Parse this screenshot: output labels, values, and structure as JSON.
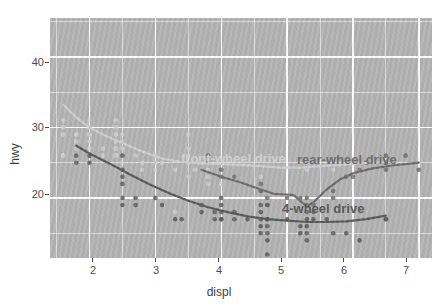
{
  "chart_data": {
    "type": "scatter",
    "title": "",
    "xlabel": "displ",
    "ylabel": "hwy",
    "xlim": [
      1.4,
      7.2
    ],
    "ylim": [
      11.5,
      45.5
    ],
    "xticks": [
      2,
      3,
      4,
      5,
      6,
      7
    ],
    "yticks": [
      20,
      30,
      40
    ],
    "grid": true,
    "legend": "none (direct labels on plot)",
    "annotations": [
      {
        "label": "front-wheel drive",
        "x": 3.45,
        "y": 25.1,
        "color": "#cfcfcf"
      },
      {
        "label": "rear-wheel drive",
        "x": 5.35,
        "y": 25.0,
        "color": "#6e6e6e"
      },
      {
        "label": "4-wheel drive",
        "x": 5.05,
        "y": 17.6,
        "color": "#5a5a5a"
      }
    ],
    "series": [
      {
        "name": "front-wheel drive",
        "color": "#cfcfcf",
        "points": [
          [
            1.6,
            29
          ],
          [
            1.6,
            29
          ],
          [
            1.6,
            31
          ],
          [
            1.6,
            30
          ],
          [
            1.6,
            26
          ],
          [
            1.6,
            26
          ],
          [
            1.8,
            29
          ],
          [
            1.8,
            29
          ],
          [
            1.8,
            28
          ],
          [
            1.8,
            27
          ],
          [
            1.8,
            26
          ],
          [
            1.8,
            25
          ],
          [
            2.0,
            29
          ],
          [
            2.0,
            29
          ],
          [
            2.0,
            28
          ],
          [
            2.0,
            27
          ],
          [
            2.0,
            31
          ],
          [
            2.0,
            30
          ],
          [
            2.2,
            26
          ],
          [
            2.2,
            27
          ],
          [
            2.4,
            27
          ],
          [
            2.4,
            26
          ],
          [
            2.4,
            29
          ],
          [
            2.4,
            30
          ],
          [
            2.4,
            31
          ],
          [
            2.4,
            26
          ],
          [
            2.4,
            27
          ],
          [
            2.4,
            29
          ],
          [
            2.4,
            28
          ],
          [
            2.5,
            29
          ],
          [
            2.5,
            28
          ],
          [
            2.5,
            27
          ],
          [
            2.5,
            24
          ],
          [
            2.5,
            25
          ],
          [
            2.7,
            26
          ],
          [
            2.7,
            20
          ],
          [
            2.8,
            24
          ],
          [
            2.8,
            25
          ],
          [
            3.0,
            26
          ],
          [
            3.0,
            25
          ],
          [
            3.0,
            24
          ],
          [
            3.1,
            25
          ],
          [
            3.3,
            24
          ],
          [
            3.3,
            18
          ],
          [
            3.5,
            29
          ],
          [
            3.5,
            27
          ],
          [
            3.5,
            26
          ],
          [
            3.5,
            25
          ],
          [
            3.5,
            23
          ],
          [
            3.6,
            24
          ],
          [
            3.8,
            25
          ],
          [
            3.8,
            24
          ],
          [
            3.8,
            23
          ],
          [
            3.8,
            22
          ],
          [
            4.0,
            23
          ],
          [
            4.0,
            22
          ],
          [
            4.2,
            23
          ],
          [
            4.6,
            23
          ],
          [
            5.3,
            25
          ],
          [
            5.3,
            24
          ],
          [
            5.7,
            24
          ],
          [
            6.1,
            24
          ]
        ],
        "smooth": [
          [
            1.6,
            33.2
          ],
          [
            1.8,
            31.4
          ],
          [
            2.0,
            30.0
          ],
          [
            2.2,
            29.0
          ],
          [
            2.5,
            27.8
          ],
          [
            2.8,
            26.6
          ],
          [
            3.1,
            25.6
          ],
          [
            3.4,
            25.1
          ],
          [
            3.7,
            24.9
          ],
          [
            4.0,
            24.8
          ],
          [
            4.3,
            24.7
          ],
          [
            4.6,
            24.5
          ],
          [
            4.9,
            24.3
          ],
          [
            5.2,
            24.3
          ],
          [
            5.5,
            24.5
          ],
          [
            5.8,
            24.7
          ],
          [
            6.1,
            24.9
          ],
          [
            6.5,
            25.1
          ]
        ]
      },
      {
        "name": "rear-wheel drive",
        "color": "#6e6e6e",
        "points": [
          [
            3.8,
            26
          ],
          [
            3.8,
            25
          ],
          [
            4.0,
            23
          ],
          [
            4.0,
            24
          ],
          [
            4.2,
            23
          ],
          [
            4.6,
            22
          ],
          [
            4.6,
            21
          ],
          [
            4.6,
            21
          ],
          [
            4.7,
            20
          ],
          [
            4.7,
            19
          ],
          [
            5.0,
            20
          ],
          [
            5.2,
            20
          ],
          [
            5.3,
            20
          ],
          [
            5.3,
            19
          ],
          [
            5.3,
            18
          ],
          [
            5.4,
            19
          ],
          [
            5.4,
            18
          ],
          [
            5.7,
            20
          ],
          [
            5.7,
            21
          ],
          [
            5.9,
            23
          ],
          [
            6.0,
            23
          ],
          [
            6.1,
            24
          ],
          [
            6.2,
            25
          ],
          [
            6.2,
            25
          ],
          [
            6.5,
            25
          ],
          [
            6.5,
            24
          ],
          [
            6.5,
            25
          ],
          [
            6.5,
            26
          ],
          [
            6.8,
            26
          ],
          [
            7.0,
            24
          ]
        ],
        "smooth": [
          [
            3.7,
            24.0
          ],
          [
            4.0,
            23.0
          ],
          [
            4.3,
            22.2
          ],
          [
            4.6,
            21.2
          ],
          [
            4.8,
            20.6
          ],
          [
            5.0,
            20.5
          ],
          [
            5.1,
            20.4
          ],
          [
            5.2,
            19.6
          ],
          [
            5.3,
            18.8
          ],
          [
            5.4,
            19.4
          ],
          [
            5.6,
            21.2
          ],
          [
            5.8,
            22.6
          ],
          [
            6.0,
            23.5
          ],
          [
            6.3,
            24.2
          ],
          [
            6.6,
            24.6
          ],
          [
            6.9,
            24.9
          ],
          [
            7.0,
            25.0
          ]
        ]
      },
      {
        "name": "4-wheel drive",
        "color": "#5a5a5a",
        "points": [
          [
            1.8,
            26
          ],
          [
            1.8,
            25
          ],
          [
            2.0,
            26
          ],
          [
            2.0,
            25
          ],
          [
            2.5,
            26
          ],
          [
            2.5,
            24
          ],
          [
            2.5,
            23
          ],
          [
            2.5,
            22
          ],
          [
            2.5,
            20
          ],
          [
            2.5,
            19
          ],
          [
            2.7,
            20
          ],
          [
            2.7,
            19
          ],
          [
            3.0,
            20
          ],
          [
            3.1,
            19
          ],
          [
            3.3,
            17
          ],
          [
            3.4,
            17
          ],
          [
            3.7,
            19
          ],
          [
            3.7,
            18
          ],
          [
            3.9,
            18
          ],
          [
            3.9,
            17
          ],
          [
            4.0,
            20
          ],
          [
            4.0,
            19
          ],
          [
            4.0,
            18
          ],
          [
            4.0,
            17
          ],
          [
            4.0,
            17
          ],
          [
            4.2,
            17
          ],
          [
            4.2,
            18
          ],
          [
            4.4,
            17
          ],
          [
            4.6,
            19
          ],
          [
            4.6,
            18
          ],
          [
            4.6,
            17
          ],
          [
            4.6,
            16
          ],
          [
            4.6,
            15
          ],
          [
            4.7,
            19
          ],
          [
            4.7,
            17
          ],
          [
            4.7,
            16
          ],
          [
            4.7,
            15
          ],
          [
            4.7,
            14
          ],
          [
            4.7,
            12
          ],
          [
            4.7,
            17
          ],
          [
            5.0,
            17
          ],
          [
            5.2,
            15
          ],
          [
            5.2,
            16
          ],
          [
            5.3,
            17
          ],
          [
            5.3,
            16
          ],
          [
            5.3,
            15
          ],
          [
            5.3,
            14
          ],
          [
            5.4,
            17
          ],
          [
            5.6,
            17
          ],
          [
            5.7,
            15
          ],
          [
            5.9,
            15
          ],
          [
            6.1,
            14
          ],
          [
            6.5,
            17
          ],
          [
            6.5,
            17
          ]
        ],
        "smooth": [
          [
            1.8,
            27.4
          ],
          [
            2.0,
            26.3
          ],
          [
            2.3,
            24.9
          ],
          [
            2.6,
            23.4
          ],
          [
            2.9,
            22.0
          ],
          [
            3.2,
            20.7
          ],
          [
            3.5,
            19.6
          ],
          [
            3.8,
            18.7
          ],
          [
            4.1,
            18.0
          ],
          [
            4.4,
            17.4
          ],
          [
            4.7,
            17.0
          ],
          [
            5.0,
            16.8
          ],
          [
            5.3,
            16.6
          ],
          [
            5.6,
            16.6
          ],
          [
            5.9,
            16.7
          ],
          [
            6.2,
            17.0
          ],
          [
            6.5,
            17.5
          ]
        ]
      }
    ]
  },
  "axes": {
    "x_label": "displ",
    "y_label": "hwy",
    "x_tick_labels": [
      "2",
      "3",
      "4",
      "5",
      "6",
      "7"
    ],
    "y_tick_labels": [
      "20",
      "30",
      "40"
    ]
  },
  "theme": {
    "panel_background": "#b4b4b4",
    "gridline_color": "#ffffff",
    "plot_background": "#ffffff",
    "axis_text_color": "#4d4d4d"
  }
}
